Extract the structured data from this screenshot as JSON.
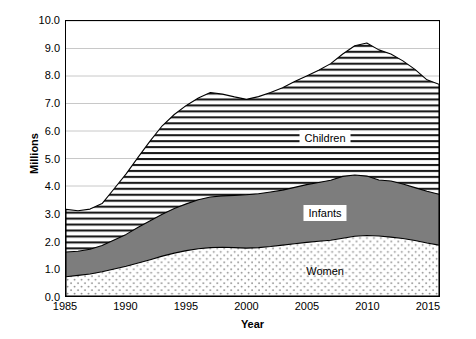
{
  "chart_data": {
    "type": "area",
    "stacked": true,
    "title": "",
    "subtitle": "",
    "xlabel": "Year",
    "ylabel": "Millions",
    "xlim": [
      1985,
      2016
    ],
    "ylim": [
      0.0,
      10.0
    ],
    "grid": true,
    "gridlines": "horizontal",
    "legend_position": "inline-annotation",
    "xticks": [
      1985,
      1990,
      1995,
      2000,
      2005,
      2010,
      2015
    ],
    "xtick_labels": [
      "1985",
      "1990",
      "1995",
      "2000",
      "2005",
      "2010",
      "2015"
    ],
    "yticks": [
      0.0,
      1.0,
      2.0,
      3.0,
      4.0,
      5.0,
      6.0,
      7.0,
      8.0,
      9.0,
      10.0
    ],
    "ytick_labels": [
      "0.0",
      "1.0",
      "2.0",
      "3.0",
      "4.0",
      "5.0",
      "6.0",
      "7.0",
      "8.0",
      "9.0",
      "10.0"
    ],
    "x": [
      1985,
      1986,
      1987,
      1988,
      1989,
      1990,
      1991,
      1992,
      1993,
      1994,
      1995,
      1996,
      1997,
      1998,
      1999,
      2000,
      2001,
      2002,
      2003,
      2004,
      2005,
      2006,
      2007,
      2008,
      2009,
      2010,
      2011,
      2012,
      2013,
      2014,
      2015,
      2016
    ],
    "series": [
      {
        "name": "Women",
        "fill": "dotted",
        "values": [
          0.7,
          0.75,
          0.8,
          0.88,
          0.98,
          1.08,
          1.2,
          1.32,
          1.45,
          1.56,
          1.65,
          1.72,
          1.76,
          1.77,
          1.76,
          1.74,
          1.76,
          1.8,
          1.85,
          1.9,
          1.95,
          1.99,
          2.03,
          2.1,
          2.17,
          2.2,
          2.18,
          2.14,
          2.09,
          2.02,
          1.93,
          1.85
        ]
      },
      {
        "name": "Infants",
        "fill": "solid-gray",
        "values": [
          0.9,
          0.88,
          0.9,
          0.96,
          1.06,
          1.16,
          1.3,
          1.42,
          1.52,
          1.62,
          1.7,
          1.78,
          1.84,
          1.87,
          1.9,
          1.94,
          1.96,
          1.98,
          2.0,
          2.05,
          2.1,
          2.14,
          2.18,
          2.25,
          2.23,
          2.16,
          2.04,
          2.04,
          1.98,
          1.92,
          1.88,
          1.85
        ]
      },
      {
        "name": "Children",
        "fill": "horizontal-hatch",
        "values": [
          1.55,
          1.47,
          1.46,
          1.52,
          1.86,
          2.2,
          2.55,
          2.9,
          3.22,
          3.42,
          3.58,
          3.7,
          3.8,
          3.7,
          3.58,
          3.47,
          3.53,
          3.62,
          3.72,
          3.85,
          3.95,
          4.08,
          4.24,
          4.45,
          4.7,
          4.84,
          4.73,
          4.62,
          4.48,
          4.3,
          4.05,
          4.0
        ]
      }
    ],
    "cumulative_tops": {
      "women_top": [
        0.7,
        0.75,
        0.8,
        0.88,
        0.98,
        1.08,
        1.2,
        1.32,
        1.45,
        1.56,
        1.65,
        1.72,
        1.76,
        1.77,
        1.76,
        1.74,
        1.76,
        1.8,
        1.85,
        1.9,
        1.95,
        1.99,
        2.03,
        2.1,
        2.17,
        2.2,
        2.18,
        2.14,
        2.09,
        2.02,
        1.93,
        1.85
      ],
      "infants_top": [
        1.6,
        1.63,
        1.7,
        1.84,
        2.04,
        2.24,
        2.5,
        2.74,
        2.97,
        3.18,
        3.35,
        3.5,
        3.6,
        3.64,
        3.66,
        3.68,
        3.72,
        3.78,
        3.85,
        3.95,
        4.05,
        4.13,
        4.21,
        4.35,
        4.4,
        4.36,
        4.22,
        4.18,
        4.07,
        3.94,
        3.81,
        3.7
      ],
      "children_top": [
        3.15,
        3.1,
        3.16,
        3.36,
        3.9,
        4.44,
        5.05,
        5.64,
        6.19,
        6.6,
        6.93,
        7.2,
        7.4,
        7.34,
        7.24,
        7.15,
        7.25,
        7.4,
        7.57,
        7.8,
        8.0,
        8.21,
        8.45,
        8.8,
        9.1,
        9.2,
        8.95,
        8.8,
        8.55,
        8.24,
        7.86,
        7.7
      ]
    },
    "annotations": [
      {
        "text": "Children",
        "x": 2006.5,
        "y": 5.75,
        "boxed": true
      },
      {
        "text": "Infants",
        "x": 2006.5,
        "y": 3.05,
        "boxed": true
      },
      {
        "text": "Women",
        "x": 2006.5,
        "y": 0.95,
        "boxed": false
      }
    ],
    "colors": {
      "axis": "#000000",
      "grid": "#c8c8c8",
      "women_fill": "#ffffff",
      "women_dot": "#8c8c8c",
      "infants_fill": "#7d7d7d",
      "children_fill": "#ffffff",
      "children_hatch": "#1a1a1a",
      "outline": "#000000",
      "background": "#ffffff"
    }
  }
}
